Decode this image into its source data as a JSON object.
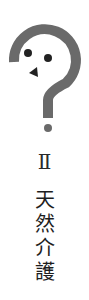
{
  "logo": {
    "icon": "question-mark-face-icon",
    "color": "#6a6a6a",
    "feature_color": "#222222"
  },
  "numeral": "Ⅱ",
  "title_chars": [
    "天",
    "然",
    "介",
    "護"
  ]
}
